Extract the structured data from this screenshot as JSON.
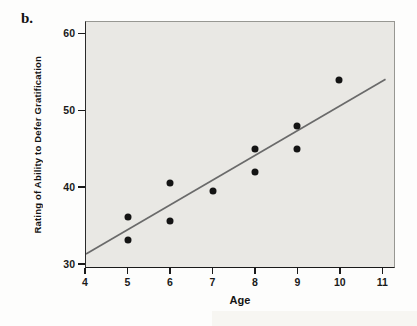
{
  "figure": {
    "panel_label": "b."
  },
  "chart_data": {
    "type": "scatter",
    "title": "",
    "xlabel": "Age",
    "ylabel": "Rating of Ability to Defer Gratification",
    "points": [
      [
        5,
        36
      ],
      [
        5,
        33
      ],
      [
        6,
        40.5
      ],
      [
        6,
        35.5
      ],
      [
        7,
        39.5
      ],
      [
        8,
        45
      ],
      [
        8,
        42
      ],
      [
        9,
        48
      ],
      [
        9,
        45
      ],
      [
        10,
        54
      ]
    ],
    "xticks": [
      "4",
      "5",
      "6",
      "7",
      "8",
      "9",
      "10",
      "11"
    ],
    "xtick_values": [
      4,
      5,
      6,
      7,
      8,
      9,
      10,
      11
    ],
    "yticks": [
      "30",
      "40",
      "50",
      "60"
    ],
    "ytick_values": [
      30,
      40,
      50,
      60
    ],
    "xlim": [
      4,
      11.3
    ],
    "ylim": [
      29.5,
      61.6
    ],
    "grid": false,
    "legend": null,
    "trend_line": {
      "x1": 4.0,
      "y1": 31.2,
      "x2": 11.1,
      "y2": 54.1
    },
    "colors": {
      "point": "#141414",
      "trend_line": "#6a6a6a",
      "plot_background": "#e9e8e4",
      "axis": "#1a1a1a",
      "text": "#1a1a1a"
    }
  }
}
